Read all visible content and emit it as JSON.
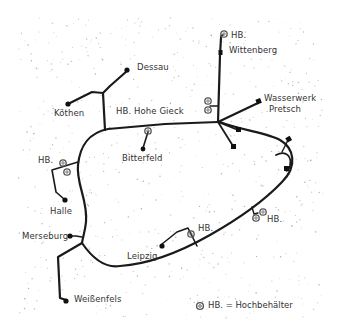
{
  "map": {
    "title": "",
    "places": [
      {
        "id": "dessau",
        "label": "Dessau"
      },
      {
        "id": "koethen",
        "label": "Köthen"
      },
      {
        "id": "hohe_gieck",
        "label": "HB. Hohe Gieck"
      },
      {
        "id": "bitterfeld",
        "label": "Bitterfeld"
      },
      {
        "id": "wittenberg_hb",
        "label": "HB."
      },
      {
        "id": "wittenberg",
        "label": "Wittenberg"
      },
      {
        "id": "wasserwerk",
        "label": "Wasserwerk"
      },
      {
        "id": "pretsch",
        "label": "Pretsch"
      },
      {
        "id": "halle_hb",
        "label": "HB."
      },
      {
        "id": "halle",
        "label": "Halle"
      },
      {
        "id": "merseburg",
        "label": "Merseburg"
      },
      {
        "id": "leipzig",
        "label": "Leipzig"
      },
      {
        "id": "leipzig_hb",
        "label": "HB."
      },
      {
        "id": "east_hb",
        "label": "HB."
      },
      {
        "id": "weissenfels",
        "label": "Weißenfels"
      }
    ],
    "legend": {
      "symbol": "double-circle",
      "text": "HB. = Hochbehälter"
    },
    "colors": {
      "line": "#1a1a1a",
      "background": "#ffffff",
      "stipple": "#9a9a9a"
    }
  }
}
